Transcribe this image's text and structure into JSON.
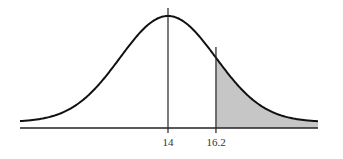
{
  "chart_data": {
    "type": "area",
    "title": "",
    "xlabel": "",
    "ylabel": "",
    "distribution": "normal",
    "mean": 14,
    "std_dev": 2.2,
    "tick_labels": [
      "14",
      "16.2"
    ],
    "ticks": [
      14,
      16.2
    ],
    "shaded_region": {
      "from": 16.2,
      "to": "infinity",
      "description": "upper tail area to the right of 16.2"
    },
    "vertical_lines": [
      14,
      16.2
    ],
    "grid": false,
    "legend": null,
    "colors": {
      "curve": "#111111",
      "shade": "#c6c6c6",
      "axis": "#222222"
    }
  },
  "labels": {
    "mean": "14",
    "cutoff": "16.2"
  }
}
